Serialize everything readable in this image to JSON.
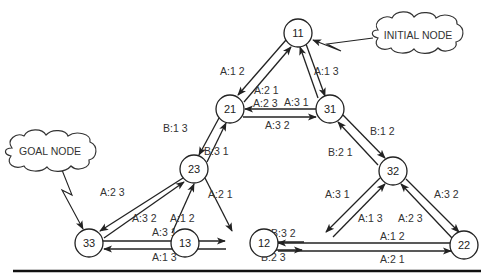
{
  "diagram": {
    "callouts": {
      "initial": {
        "label": "INITIAL NODE",
        "target": "11"
      },
      "goal": {
        "label": "GOAL NODE",
        "target": "33"
      }
    },
    "nodes": [
      {
        "id": "11",
        "label": "11",
        "x": 298,
        "y": 33
      },
      {
        "id": "21",
        "label": "21",
        "x": 230,
        "y": 109
      },
      {
        "id": "31",
        "label": "31",
        "x": 330,
        "y": 109
      },
      {
        "id": "23",
        "label": "23",
        "x": 194,
        "y": 169
      },
      {
        "id": "32",
        "label": "32",
        "x": 393,
        "y": 171
      },
      {
        "id": "33",
        "label": "33",
        "x": 89,
        "y": 243
      },
      {
        "id": "13",
        "label": "13",
        "x": 185,
        "y": 243
      },
      {
        "id": "12",
        "label": "12",
        "x": 264,
        "y": 243
      },
      {
        "id": "22",
        "label": "22",
        "x": 464,
        "y": 245
      }
    ],
    "edges": [
      {
        "from": "11",
        "to": "21",
        "label": "A:1 2"
      },
      {
        "from": "21",
        "to": "11",
        "label": "A:2 1"
      },
      {
        "from": "11",
        "to": "31",
        "label": "A:1 3"
      },
      {
        "from": "31",
        "to": "11",
        "label": "A:3 1"
      },
      {
        "from": "31",
        "to": "21",
        "label": "A:2 3"
      },
      {
        "from": "21",
        "to": "31",
        "label": "A:3 2"
      },
      {
        "from": "21",
        "to": "23",
        "label": "B:1 3"
      },
      {
        "from": "23",
        "to": "21",
        "label": "B:3 1"
      },
      {
        "from": "31",
        "to": "32",
        "label": "B:1 2"
      },
      {
        "from": "32",
        "to": "31",
        "label": "B:2 1"
      },
      {
        "from": "23",
        "to": "33",
        "label": "A:2 3"
      },
      {
        "from": "33",
        "to": "23",
        "label": "A:3 2"
      },
      {
        "from": "23",
        "to": "13",
        "label": "A:2 1"
      },
      {
        "from": "13",
        "to": "23",
        "label": "A:1 2"
      },
      {
        "from": "33",
        "to": "13",
        "label": "A:3 1"
      },
      {
        "from": "13",
        "to": "33",
        "label": "A:1 3"
      },
      {
        "from": "12",
        "to": "13",
        "label": "B:3 2"
      },
      {
        "from": "13",
        "to": "12",
        "label": "B:2 3"
      },
      {
        "from": "32",
        "to": "12",
        "label": "A:3 1"
      },
      {
        "from": "12",
        "to": "32",
        "label": "A:1 3"
      },
      {
        "from": "32",
        "to": "22",
        "label": "A:3 2"
      },
      {
        "from": "22",
        "to": "32",
        "label": "A:2 3"
      },
      {
        "from": "22",
        "to": "12",
        "label": "A:1 2"
      },
      {
        "from": "12",
        "to": "22",
        "label": "A:2 1"
      }
    ]
  }
}
